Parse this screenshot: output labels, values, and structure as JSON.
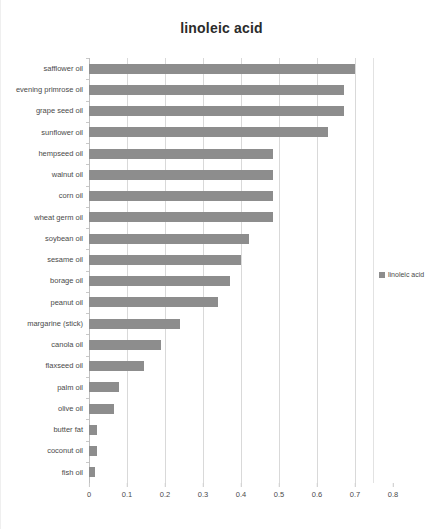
{
  "chart_data": {
    "type": "bar",
    "orientation": "horizontal",
    "title": "linoleic acid",
    "xlabel": "",
    "ylabel": "",
    "xlim": [
      0,
      0.8
    ],
    "xticks": [
      "0",
      "0.1",
      "0.2",
      "0.3",
      "0.4",
      "0.5",
      "0.6",
      "0.7",
      "0.8"
    ],
    "xtick_values": [
      0,
      0.1,
      0.2,
      0.3,
      0.4,
      0.5,
      0.6,
      0.7,
      0.8
    ],
    "grid": true,
    "legend": [
      "linoleic acid"
    ],
    "legend_position": "right",
    "series_color": "#8d8d8d",
    "categories": [
      "safflower oil",
      "evening primrose oil",
      "grape seed oil",
      "sunflower oil",
      "hempseed oil",
      "walnut oil",
      "corn oil",
      "wheat germ oil",
      "soybean oil",
      "sesame oil",
      "borage oil",
      "peanut oil",
      "margarine (stick)",
      "canola oil",
      "flaxseed oil",
      "palm oil",
      "olive oil",
      "butter fat",
      "coconut oil",
      "fish oil"
    ],
    "values": [
      0.7,
      0.67,
      0.67,
      0.63,
      0.485,
      0.485,
      0.485,
      0.485,
      0.42,
      0.4,
      0.37,
      0.34,
      0.24,
      0.19,
      0.145,
      0.08,
      0.065,
      0.02,
      0.02,
      0.015
    ]
  }
}
